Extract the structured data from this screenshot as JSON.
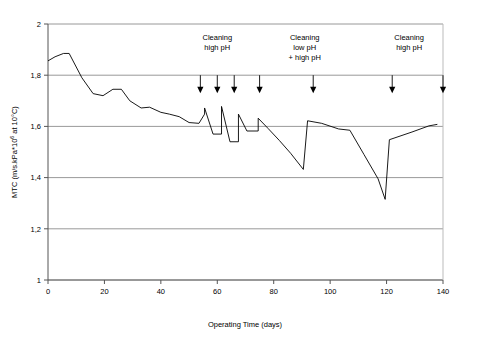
{
  "chart_data": {
    "type": "line",
    "title": "",
    "xlabel": "Operating Time  (days)",
    "ylabel_full": "MTC (m/s.kPa*10",
    "ylabel_sup": "6",
    "ylabel_tail": " at 10°C)",
    "xlim": [
      0,
      140
    ],
    "ylim": [
      1,
      2
    ],
    "xticks": [
      0,
      20,
      40,
      60,
      80,
      100,
      120,
      140
    ],
    "xticklabels": [
      "0",
      "20",
      "40",
      "60",
      "80",
      "100",
      "120",
      "140"
    ],
    "yticks": [
      1,
      1.2,
      1.4,
      1.6,
      1.8,
      2
    ],
    "yticklabels": [
      "1",
      "1,2",
      "1,4",
      "1,6",
      "1,8",
      "2"
    ],
    "grid": "horizontal",
    "legend": "none",
    "series": [
      {
        "name": "MTC",
        "x": [
          0,
          2.5,
          5.5,
          7.5,
          12,
          16,
          19.5,
          23,
          26,
          29,
          33,
          36,
          40,
          43,
          46.5,
          50,
          53.5,
          55.5,
          55.5,
          58.5,
          61.5,
          61.5,
          64.5,
          67.5,
          67.5,
          70.5,
          74.5,
          74.5,
          78,
          82,
          86,
          90.5,
          90.5,
          92,
          97,
          103,
          107,
          112,
          117,
          119.5,
          119.5,
          121,
          129,
          135,
          138
        ],
        "y": [
          1.856,
          1.872,
          1.885,
          1.885,
          1.79,
          1.728,
          1.72,
          1.745,
          1.745,
          1.7,
          1.672,
          1.675,
          1.655,
          1.648,
          1.638,
          1.615,
          1.612,
          1.648,
          1.672,
          1.57,
          1.57,
          1.678,
          1.54,
          1.54,
          1.648,
          1.582,
          1.582,
          1.632,
          1.592,
          1.545,
          1.495,
          1.432,
          1.432,
          1.622,
          1.612,
          1.59,
          1.585,
          1.49,
          1.395,
          1.315,
          1.315,
          1.548,
          1.578,
          1.602,
          1.608
        ]
      }
    ],
    "annotations": [
      {
        "id": "ann-cleaning-high-ph-1",
        "lines": [
          "Cleaning",
          "high pH"
        ],
        "x_center": 60
      },
      {
        "id": "ann-cleaning-low-high-ph",
        "lines": [
          "Cleaning",
          "low pH",
          "+ high pH"
        ],
        "x_center": 91
      },
      {
        "id": "ann-cleaning-high-ph-2",
        "lines": [
          "Cleaning",
          "high pH"
        ],
        "x_center": 128
      }
    ],
    "event_arrows": {
      "label": "cleaning event",
      "y_top": 1.8,
      "y_head": 1.735,
      "x_days": [
        54,
        60,
        66,
        75,
        94,
        122,
        140
      ]
    },
    "axis_color": "#000000",
    "grid_color": "#7f7f7f",
    "series_color": "#000000"
  }
}
